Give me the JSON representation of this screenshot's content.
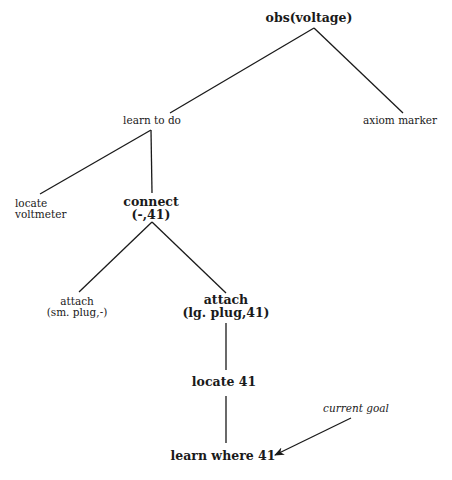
{
  "diagram": {
    "type": "goal-tree",
    "stroke_color": "#1a1a1a",
    "background": "#ffffff",
    "nodes": [
      {
        "id": "obs-voltage",
        "lines": [
          "obs(voltage)"
        ],
        "style": "bold",
        "x": 309,
        "y": 12
      },
      {
        "id": "learn-to-do",
        "lines": [
          "learn to do"
        ],
        "style": "plain",
        "x": 152,
        "y": 115
      },
      {
        "id": "axiom-marker",
        "lines": [
          "axiom marker"
        ],
        "style": "plain",
        "x": 400,
        "y": 115
      },
      {
        "id": "locate-voltmeter",
        "lines": [
          "locate",
          "voltmeter"
        ],
        "style": "plain",
        "x": 15,
        "y": 198
      },
      {
        "id": "connect",
        "lines": [
          "connect",
          "(-,41)"
        ],
        "style": "bold",
        "x": 151,
        "y": 196
      },
      {
        "id": "attach-sm-plug",
        "lines": [
          "attach",
          "(sm. plug,-)"
        ],
        "style": "plain",
        "x": 77,
        "y": 296
      },
      {
        "id": "attach-lg-plug",
        "lines": [
          "attach",
          "(lg. plug,41)"
        ],
        "style": "bold",
        "x": 226,
        "y": 294
      },
      {
        "id": "locate-41",
        "lines": [
          "locate 41"
        ],
        "style": "bold",
        "x": 224,
        "y": 376
      },
      {
        "id": "learn-where-41",
        "lines": [
          "learn where 41"
        ],
        "style": "bold",
        "x": 223,
        "y": 450
      }
    ],
    "annotation": {
      "id": "current-goal",
      "text": "current goal",
      "style": "italic",
      "x": 356,
      "y": 403,
      "points_to": "learn-where-41"
    },
    "edges": [
      {
        "from": "obs-voltage",
        "to": "learn-to-do",
        "x1": 314,
        "y1": 28,
        "x2": 170,
        "y2": 113
      },
      {
        "from": "obs-voltage",
        "to": "axiom-marker",
        "x1": 314,
        "y1": 28,
        "x2": 403,
        "y2": 113
      },
      {
        "from": "learn-to-do",
        "to": "locate-voltmeter",
        "x1": 151,
        "y1": 130,
        "x2": 40,
        "y2": 194
      },
      {
        "from": "learn-to-do",
        "to": "connect",
        "x1": 151,
        "y1": 130,
        "x2": 152,
        "y2": 193
      },
      {
        "from": "connect",
        "to": "attach-sm-plug",
        "x1": 152,
        "y1": 222,
        "x2": 79,
        "y2": 292
      },
      {
        "from": "connect",
        "to": "attach-lg-plug",
        "x1": 152,
        "y1": 222,
        "x2": 226,
        "y2": 293
      },
      {
        "from": "attach-lg-plug",
        "to": "locate-41",
        "x1": 226,
        "y1": 323,
        "x2": 226,
        "y2": 370
      },
      {
        "from": "locate-41",
        "to": "learn-where-41",
        "x1": 226,
        "y1": 396,
        "x2": 226,
        "y2": 443
      }
    ],
    "arrow": {
      "from": "current-goal",
      "to": "learn-where-41",
      "x1": 351,
      "y1": 418,
      "x2": 275,
      "y2": 455
    }
  }
}
